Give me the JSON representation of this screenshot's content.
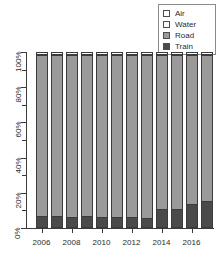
{
  "chart_data": {
    "type": "bar",
    "subtype": "stacked-100-percent",
    "title": "",
    "xlabel": "",
    "ylabel": "",
    "categories": [
      "2006",
      "2007",
      "2008",
      "2009",
      "2010",
      "2011",
      "2012",
      "2013",
      "2014",
      "2015",
      "2016",
      "2017"
    ],
    "x_tick_labels": [
      "2006",
      "2008",
      "2010",
      "2012",
      "2014",
      "2016"
    ],
    "x_tick_label_indices": [
      0,
      2,
      4,
      6,
      8,
      10
    ],
    "y_tick_labels": [
      "0%",
      "20%",
      "40%",
      "60%",
      "80%",
      "100%"
    ],
    "y_tick_values": [
      0,
      20,
      40,
      60,
      80,
      100
    ],
    "y_minor_tick_values": [
      10,
      30,
      50,
      70,
      90
    ],
    "ylim": [
      0,
      100
    ],
    "grid": false,
    "legend_position": "top-right",
    "series": [
      {
        "name": "Train",
        "color": "#4a4a4a",
        "values": [
          6.5,
          6.5,
          6.0,
          6.2,
          5.8,
          5.8,
          5.6,
          5.2,
          10.5,
          10.5,
          13.0,
          15.0
        ]
      },
      {
        "name": "Road",
        "color": "#9a9a9a",
        "values": [
          92.3,
          92.3,
          92.8,
          92.6,
          93.0,
          93.0,
          93.2,
          93.6,
          88.4,
          88.4,
          85.9,
          83.9
        ]
      },
      {
        "name": "Water",
        "color": "#fbfbfb",
        "values": [
          0.7,
          0.7,
          0.7,
          0.7,
          0.7,
          0.7,
          0.7,
          0.7,
          0.6,
          0.6,
          0.6,
          0.6
        ]
      },
      {
        "name": "Air",
        "color": "#ffffff",
        "values": [
          0.5,
          0.5,
          0.5,
          0.5,
          0.5,
          0.5,
          0.5,
          0.5,
          0.5,
          0.5,
          0.5,
          0.5
        ]
      }
    ]
  },
  "legend": {
    "items": [
      {
        "label": "Air",
        "color": "#ffffff",
        "icon": "legend-swatch-air"
      },
      {
        "label": "Water",
        "color": "#fbfbfb",
        "icon": "legend-swatch-water"
      },
      {
        "label": "Road",
        "color": "#9a9a9a",
        "icon": "legend-swatch-road"
      },
      {
        "label": "Train",
        "color": "#4a4a4a",
        "icon": "legend-swatch-train"
      }
    ]
  },
  "axes": {
    "y_labels": [
      "0%",
      "20%",
      "40%",
      "60%",
      "80%",
      "100%"
    ],
    "x_labels": [
      "2006",
      "2008",
      "2010",
      "2012",
      "2014",
      "2016"
    ]
  }
}
